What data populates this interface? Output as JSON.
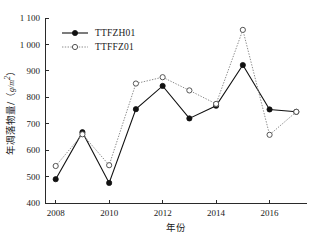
{
  "chart_data": {
    "type": "line",
    "title": "",
    "xlabel": "年份",
    "ylabel": "年凋落物量/（g/m²）",
    "ylabel_main": "年凋落物量/（",
    "ylabel_unit": "g/m",
    "ylabel_unit_sup": "2",
    "ylabel_close": "）",
    "x": [
      2008,
      2009,
      2010,
      2011,
      2012,
      2013,
      2014,
      2015,
      2016,
      2017
    ],
    "xtick_values": [
      2008,
      2010,
      2012,
      2014,
      2016
    ],
    "xtick_labels": [
      "2008",
      "2010",
      "2012",
      "2014",
      "2016"
    ],
    "xlim": [
      2007.6,
      2017.4
    ],
    "ytick_values": [
      400,
      500,
      600,
      700,
      800,
      900,
      1000,
      1100
    ],
    "ytick_labels": [
      "400",
      "500",
      "600",
      "700",
      "800",
      "900",
      "1 000",
      "1 100"
    ],
    "ylim": [
      400,
      1100
    ],
    "grid": false,
    "legend_position": "upper-left-inside",
    "series": [
      {
        "name": "TTFZH01",
        "marker": "filled-circle",
        "linestyle": "solid",
        "color": "#111111",
        "values": [
          490,
          668,
          476,
          755,
          843,
          720,
          768,
          922,
          754,
          745
        ]
      },
      {
        "name": "TTFFZ01",
        "marker": "open-circle",
        "linestyle": "dotted",
        "color": "#8c8c8c",
        "values": [
          540,
          660,
          543,
          852,
          876,
          826,
          775,
          1055,
          658,
          745
        ]
      }
    ]
  },
  "legend": {
    "items": [
      {
        "label": "TTFZH01"
      },
      {
        "label": "TTFFZ01"
      }
    ]
  }
}
